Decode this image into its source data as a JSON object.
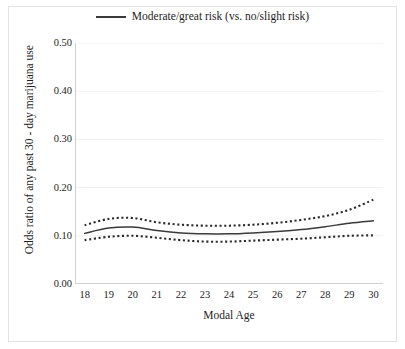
{
  "chart_data": {
    "type": "line",
    "title": "",
    "xlabel": "Modal Age",
    "ylabel": "Odds ratio of any past 30 - day marijuana use",
    "xlim": [
      17.6,
      30.4
    ],
    "ylim": [
      0.0,
      0.5
    ],
    "grid": true,
    "grid_axis": "y",
    "legend_position": "top-center",
    "x_tick_labels": [
      "18",
      "19",
      "20",
      "21",
      "22",
      "23",
      "24",
      "25",
      "26",
      "27",
      "28",
      "29",
      "30"
    ],
    "y_tick_labels": [
      "0.00",
      "0.10",
      "0.20",
      "0.30",
      "0.40",
      "0.50"
    ],
    "y_ticks": [
      0.0,
      0.1,
      0.2,
      0.3,
      0.4,
      0.5
    ],
    "x": [
      18,
      19,
      20,
      21,
      22,
      23,
      24,
      25,
      26,
      27,
      28,
      29,
      30
    ],
    "series": [
      {
        "name": "Moderate/great risk (vs. no/slight risk)",
        "style": "solid",
        "color": "#3a3a3a",
        "values": [
          0.105,
          0.116,
          0.118,
          0.111,
          0.106,
          0.104,
          0.104,
          0.106,
          0.109,
          0.113,
          0.119,
          0.126,
          0.131
        ]
      },
      {
        "name": "Upper 95% confidence limit",
        "style": "dotted",
        "color": "#2b2b2b",
        "values": [
          0.122,
          0.135,
          0.137,
          0.128,
          0.123,
          0.121,
          0.121,
          0.123,
          0.127,
          0.133,
          0.141,
          0.154,
          0.175
        ]
      },
      {
        "name": "Lower 95% confidence limit",
        "style": "dotted",
        "color": "#2b2b2b",
        "values": [
          0.091,
          0.098,
          0.1,
          0.096,
          0.091,
          0.088,
          0.088,
          0.09,
          0.092,
          0.094,
          0.097,
          0.1,
          0.101
        ]
      }
    ],
    "legend": [
      {
        "label": "Moderate/great risk (vs. no/slight risk)",
        "style": "solid",
        "color": "#3a3a3a"
      }
    ]
  },
  "legend": {
    "entry_label": "Moderate/great risk (vs. no/slight risk)"
  },
  "axes": {
    "x_title": "Modal Age",
    "y_title": "Odds ratio of any past 30 - day marijuana use"
  },
  "colors": {
    "line": "#3a3a3a",
    "band": "#2b2b2b",
    "grid": "#f0f0f0",
    "axis": "#cfcfcf",
    "frame": "#e2e2e2",
    "text": "#1d1d1d",
    "background": "#ffffff"
  }
}
